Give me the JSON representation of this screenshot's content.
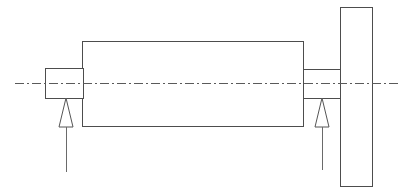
{
  "drawing": {
    "title": "Shaft Assembly Elevation",
    "type": "engineering-line-drawing",
    "canvas": {
      "width": 410,
      "height": 195,
      "background": "#ffffff"
    },
    "colors": {
      "outline": "#4d4d4d",
      "centerline": "#5a5a5a",
      "leader": "#6a6a6a",
      "support": "#555555",
      "fill": "#ffffff"
    },
    "parts": {
      "left_stub_shaft": {
        "label": "left stub shaft",
        "x": 45,
        "y": 68,
        "width": 38,
        "height": 30
      },
      "main_body": {
        "label": "main cylindrical body",
        "x": 82,
        "y": 41,
        "width": 221,
        "height": 85
      },
      "right_stub_shaft": {
        "label": "right stub shaft",
        "x": 303,
        "y": 69,
        "width": 37,
        "height": 29
      },
      "end_plate": {
        "label": "vertical end plate",
        "x": 340,
        "y": 7,
        "width": 32,
        "height": 179
      }
    },
    "centerline": {
      "label": "axis of rotation centerline",
      "y": 83,
      "x_start": 15,
      "x_end": 398,
      "dash_pattern": "9 3 2 3"
    },
    "supports": [
      {
        "name": "left-support",
        "label": "left support reaction",
        "apex_x": 66,
        "apex_y": 98,
        "base_y": 127,
        "base_half_width": 7,
        "leader_x": 66,
        "leader_y_start": 127,
        "leader_y_end": 172
      },
      {
        "name": "right-support",
        "label": "right support reaction",
        "apex_x": 322,
        "apex_y": 98,
        "base_y": 127,
        "base_half_width": 7,
        "leader_x": 322,
        "leader_y_start": 127,
        "leader_y_end": 170
      }
    ]
  }
}
